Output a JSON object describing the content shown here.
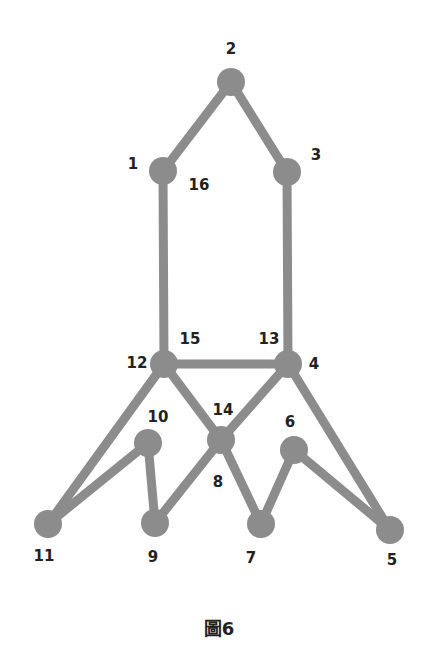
{
  "diagram": {
    "caption": "圖6",
    "edge_color": "#8c8c8c",
    "node_color": "#8c8c8c",
    "nodes": [
      {
        "id": "2",
        "x": 231,
        "y": 82
      },
      {
        "id": "1",
        "x": 163,
        "y": 171
      },
      {
        "id": "3",
        "x": 287,
        "y": 172
      },
      {
        "id": "12",
        "x": 164,
        "y": 364
      },
      {
        "id": "4",
        "x": 288,
        "y": 364
      },
      {
        "id": "8",
        "x": 221,
        "y": 440
      },
      {
        "id": "10",
        "x": 148,
        "y": 443
      },
      {
        "id": "6",
        "x": 294,
        "y": 450
      },
      {
        "id": "11",
        "x": 48,
        "y": 524
      },
      {
        "id": "9",
        "x": 155,
        "y": 523
      },
      {
        "id": "7",
        "x": 261,
        "y": 524
      },
      {
        "id": "5",
        "x": 390,
        "y": 530
      }
    ],
    "edges": [
      [
        "2",
        "1"
      ],
      [
        "2",
        "3"
      ],
      [
        "1",
        "12"
      ],
      [
        "3",
        "4"
      ],
      [
        "12",
        "4"
      ],
      [
        "12",
        "11"
      ],
      [
        "12",
        "8"
      ],
      [
        "4",
        "8"
      ],
      [
        "4",
        "5"
      ],
      [
        "11",
        "10"
      ],
      [
        "10",
        "9"
      ],
      [
        "8",
        "9"
      ],
      [
        "8",
        "7"
      ],
      [
        "7",
        "6"
      ],
      [
        "6",
        "5"
      ]
    ],
    "labels": [
      {
        "text": "2",
        "x": 231,
        "y": 49
      },
      {
        "text": "1",
        "x": 133,
        "y": 164
      },
      {
        "text": "16",
        "x": 199,
        "y": 185
      },
      {
        "text": "3",
        "x": 316,
        "y": 155
      },
      {
        "text": "15",
        "x": 190,
        "y": 339
      },
      {
        "text": "13",
        "x": 269,
        "y": 339
      },
      {
        "text": "12",
        "x": 137,
        "y": 363
      },
      {
        "text": "4",
        "x": 314,
        "y": 364
      },
      {
        "text": "14",
        "x": 223,
        "y": 410
      },
      {
        "text": "10",
        "x": 158,
        "y": 417
      },
      {
        "text": "6",
        "x": 290,
        "y": 422
      },
      {
        "text": "8",
        "x": 218,
        "y": 482
      },
      {
        "text": "11",
        "x": 44,
        "y": 556
      },
      {
        "text": "9",
        "x": 153,
        "y": 557
      },
      {
        "text": "7",
        "x": 251,
        "y": 558
      },
      {
        "text": "5",
        "x": 392,
        "y": 560
      }
    ]
  }
}
